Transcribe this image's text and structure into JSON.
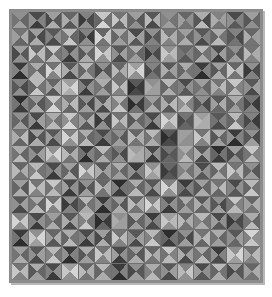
{
  "artwork": {
    "title": "Triangle Quilt Pattern",
    "kind": "generative-grid-art",
    "grid": {
      "columns": 15,
      "rows": 16
    },
    "cell_subdivision": "four-triangles-by-diagonals",
    "palette_name": "grayscale",
    "colors": {
      "page_background": "#ffffff",
      "frame": "#8c8c8c",
      "frame_shadow": "#5e5e5e",
      "cell_gap": "#6f6f6f"
    },
    "geometry": {
      "frame_x": 9,
      "frame_y": 9,
      "frame_width": 254,
      "frame_height": 274,
      "canvas_width": 248,
      "canvas_height": 268,
      "cell_width": 16.533,
      "cell_height": 16.75
    },
    "tone_levels": [
      "#1b1b1b",
      "#2d2d2d",
      "#3b3b3b",
      "#4a4a4a",
      "#585858",
      "#666666",
      "#747474",
      "#828282",
      "#909090",
      "#9e9e9e",
      "#acacac",
      "#b9b9b9",
      "#c7c7c7",
      "#d5d5d5",
      "#e3e3e3"
    ],
    "triangle_order": [
      "north",
      "east",
      "south",
      "west"
    ],
    "cells": [
      [
        [
          8,
          5,
          9,
          6
        ],
        [
          3,
          7,
          2,
          8
        ],
        [
          9,
          4,
          10,
          3
        ],
        [
          5,
          9,
          4,
          10
        ],
        [
          7,
          3,
          8,
          2
        ],
        [
          12,
          6,
          13,
          5
        ],
        [
          6,
          11,
          5,
          12
        ],
        [
          9,
          4,
          8,
          5
        ],
        [
          4,
          10,
          3,
          11
        ],
        [
          8,
          6,
          9,
          7
        ],
        [
          5,
          8,
          6,
          9
        ],
        [
          10,
          3,
          11,
          4
        ],
        [
          7,
          9,
          6,
          10
        ],
        [
          3,
          7,
          4,
          8
        ],
        [
          9,
          5,
          8,
          4
        ]
      ],
      [
        [
          6,
          10,
          5,
          9
        ],
        [
          9,
          3,
          10,
          4
        ],
        [
          4,
          8,
          3,
          7
        ],
        [
          11,
          5,
          12,
          6
        ],
        [
          7,
          2,
          8,
          3
        ],
        [
          5,
          12,
          6,
          13
        ],
        [
          10,
          6,
          9,
          5
        ],
        [
          3,
          9,
          4,
          10
        ],
        [
          8,
          4,
          7,
          3
        ],
        [
          6,
          10,
          7,
          11
        ],
        [
          9,
          5,
          10,
          6
        ],
        [
          4,
          7,
          3,
          8
        ],
        [
          10,
          6,
          11,
          5
        ],
        [
          7,
          3,
          6,
          4
        ],
        [
          5,
          9,
          6,
          10
        ]
      ],
      [
        [
          9,
          4,
          8,
          3
        ],
        [
          5,
          11,
          6,
          12
        ],
        [
          12,
          6,
          11,
          5
        ],
        [
          3,
          8,
          2,
          7
        ],
        [
          9,
          5,
          10,
          4
        ],
        [
          7,
          12,
          8,
          13
        ],
        [
          4,
          9,
          3,
          8
        ],
        [
          10,
          5,
          9,
          6
        ],
        [
          6,
          3,
          7,
          2
        ],
        [
          8,
          11,
          9,
          12
        ],
        [
          5,
          7,
          4,
          6
        ],
        [
          11,
          6,
          10,
          5
        ],
        [
          3,
          9,
          2,
          8
        ],
        [
          8,
          4,
          9,
          5
        ],
        [
          6,
          10,
          7,
          11
        ]
      ],
      [
        [
          2,
          8,
          1,
          7
        ],
        [
          10,
          5,
          11,
          6
        ],
        [
          6,
          12,
          7,
          13
        ],
        [
          4,
          9,
          3,
          10
        ],
        [
          11,
          6,
          10,
          5
        ],
        [
          8,
          4,
          9,
          3
        ],
        [
          5,
          10,
          6,
          11
        ],
        [
          9,
          13,
          8,
          12
        ],
        [
          7,
          4,
          6,
          3
        ],
        [
          4,
          9,
          5,
          10
        ],
        [
          10,
          6,
          9,
          5
        ],
        [
          2,
          7,
          1,
          6
        ],
        [
          9,
          5,
          10,
          4
        ],
        [
          5,
          11,
          6,
          12
        ],
        [
          8,
          3,
          7,
          2
        ]
      ],
      [
        [
          7,
          3,
          8,
          4
        ],
        [
          11,
          6,
          12,
          5
        ],
        [
          5,
          10,
          4,
          9
        ],
        [
          9,
          13,
          10,
          12
        ],
        [
          3,
          8,
          2,
          7
        ],
        [
          10,
          5,
          9,
          6
        ],
        [
          6,
          11,
          7,
          12
        ],
        [
          4,
          2,
          3,
          1
        ],
        [
          8,
          9,
          9,
          10
        ],
        [
          11,
          6,
          10,
          5
        ],
        [
          3,
          8,
          4,
          7
        ],
        [
          9,
          5,
          8,
          6
        ],
        [
          6,
          11,
          7,
          10
        ],
        [
          12,
          7,
          11,
          6
        ],
        [
          4,
          9,
          3,
          8
        ]
      ],
      [
        [
          1,
          7,
          2,
          6
        ],
        [
          9,
          4,
          10,
          5
        ],
        [
          12,
          7,
          13,
          6
        ],
        [
          6,
          11,
          5,
          10
        ],
        [
          8,
          3,
          9,
          4
        ],
        [
          4,
          10,
          3,
          9
        ],
        [
          11,
          6,
          12,
          7
        ],
        [
          7,
          2,
          6,
          1
        ],
        [
          9,
          5,
          10,
          6
        ],
        [
          5,
          11,
          4,
          10
        ],
        [
          12,
          7,
          11,
          8
        ],
        [
          8,
          3,
          7,
          4
        ],
        [
          4,
          10,
          5,
          9
        ],
        [
          10,
          6,
          9,
          5
        ],
        [
          6,
          2,
          7,
          3
        ]
      ],
      [
        [
          8,
          4,
          9,
          5
        ],
        [
          3,
          9,
          2,
          8
        ],
        [
          10,
          6,
          11,
          7
        ],
        [
          12,
          7,
          13,
          8
        ],
        [
          5,
          10,
          4,
          9
        ],
        [
          9,
          3,
          8,
          2
        ],
        [
          6,
          11,
          7,
          12
        ],
        [
          10,
          5,
          9,
          4
        ],
        [
          3,
          8,
          2,
          7
        ],
        [
          8,
          12,
          9,
          13
        ],
        [
          6,
          4,
          5,
          3
        ],
        [
          9,
          10,
          10,
          11
        ],
        [
          4,
          7,
          3,
          6
        ],
        [
          11,
          6,
          12,
          5
        ],
        [
          7,
          2,
          6,
          3
        ]
      ],
      [
        [
          6,
          11,
          5,
          10
        ],
        [
          9,
          4,
          10,
          3
        ],
        [
          4,
          8,
          3,
          9
        ],
        [
          7,
          12,
          8,
          13
        ],
        [
          10,
          5,
          11,
          6
        ],
        [
          3,
          7,
          2,
          6
        ],
        [
          8,
          4,
          9,
          5
        ],
        [
          5,
          10,
          6,
          11
        ],
        [
          11,
          7,
          10,
          6
        ],
        [
          4,
          2,
          3,
          1
        ],
        [
          9,
          8,
          8,
          9
        ],
        [
          6,
          11,
          7,
          12
        ],
        [
          10,
          5,
          9,
          4
        ],
        [
          2,
          7,
          1,
          8
        ],
        [
          8,
          3,
          9,
          4
        ]
      ],
      [
        [
          10,
          5,
          11,
          6
        ],
        [
          4,
          9,
          3,
          8
        ],
        [
          8,
          13,
          9,
          12
        ],
        [
          5,
          10,
          6,
          11
        ],
        [
          2,
          7,
          1,
          6
        ],
        [
          11,
          6,
          10,
          5
        ],
        [
          7,
          3,
          8,
          4
        ],
        [
          9,
          10,
          10,
          11
        ],
        [
          3,
          8,
          2,
          9
        ],
        [
          6,
          4,
          5,
          3
        ],
        [
          10,
          7,
          11,
          8
        ],
        [
          4,
          9,
          3,
          10
        ],
        [
          1,
          6,
          2,
          5
        ],
        [
          9,
          4,
          8,
          3
        ],
        [
          12,
          7,
          11,
          6
        ]
      ],
      [
        [
          5,
          10,
          6,
          11
        ],
        [
          11,
          6,
          12,
          7
        ],
        [
          3,
          8,
          2,
          7
        ],
        [
          9,
          4,
          10,
          5
        ],
        [
          7,
          12,
          8,
          13
        ],
        [
          4,
          9,
          5,
          10
        ],
        [
          10,
          5,
          9,
          6
        ],
        [
          2,
          7,
          3,
          8
        ],
        [
          8,
          11,
          9,
          12
        ],
        [
          5,
          3,
          4,
          2
        ],
        [
          9,
          6,
          10,
          7
        ],
        [
          3,
          8,
          4,
          9
        ],
        [
          11,
          6,
          10,
          5
        ],
        [
          6,
          11,
          7,
          12
        ],
        [
          8,
          4,
          9,
          5
        ]
      ],
      [
        [
          9,
          4,
          10,
          5
        ],
        [
          6,
          11,
          7,
          12
        ],
        [
          12,
          7,
          11,
          6
        ],
        [
          3,
          8,
          2,
          9
        ],
        [
          8,
          4,
          9,
          3
        ],
        [
          5,
          10,
          6,
          11
        ],
        [
          1,
          6,
          2,
          7
        ],
        [
          10,
          5,
          11,
          6
        ],
        [
          4,
          9,
          3,
          8
        ],
        [
          7,
          12,
          8,
          13
        ],
        [
          2,
          7,
          3,
          6
        ],
        [
          9,
          5,
          10,
          4
        ],
        [
          6,
          11,
          5,
          10
        ],
        [
          3,
          8,
          4,
          7
        ],
        [
          11,
          6,
          12,
          5
        ]
      ],
      [
        [
          4,
          9,
          3,
          8
        ],
        [
          10,
          5,
          11,
          6
        ],
        [
          6,
          12,
          7,
          13
        ],
        [
          8,
          3,
          7,
          2
        ],
        [
          11,
          6,
          10,
          5
        ],
        [
          2,
          7,
          1,
          8
        ],
        [
          9,
          4,
          10,
          5
        ],
        [
          5,
          10,
          6,
          11
        ],
        [
          7,
          12,
          8,
          13
        ],
        [
          3,
          8,
          2,
          7
        ],
        [
          10,
          6,
          9,
          5
        ],
        [
          4,
          9,
          5,
          10
        ],
        [
          8,
          3,
          9,
          4
        ],
        [
          12,
          7,
          11,
          6
        ],
        [
          5,
          10,
          6,
          9
        ]
      ],
      [
        [
          7,
          12,
          8,
          13
        ],
        [
          3,
          8,
          2,
          7
        ],
        [
          9,
          5,
          10,
          6
        ],
        [
          4,
          9,
          3,
          10
        ],
        [
          11,
          6,
          12,
          7
        ],
        [
          6,
          2,
          5,
          1
        ],
        [
          8,
          9,
          9,
          10
        ],
        [
          10,
          5,
          9,
          4
        ],
        [
          2,
          7,
          3,
          8
        ],
        [
          9,
          11,
          8,
          12
        ],
        [
          5,
          10,
          6,
          11
        ],
        [
          11,
          6,
          10,
          7
        ],
        [
          3,
          8,
          4,
          9
        ],
        [
          7,
          3,
          6,
          2
        ],
        [
          10,
          5,
          11,
          6
        ]
      ],
      [
        [
          2,
          7,
          1,
          6
        ],
        [
          8,
          13,
          9,
          12
        ],
        [
          5,
          10,
          4,
          9
        ],
        [
          10,
          6,
          11,
          5
        ],
        [
          3,
          8,
          2,
          7
        ],
        [
          9,
          4,
          10,
          3
        ],
        [
          6,
          11,
          7,
          12
        ],
        [
          4,
          9,
          3,
          8
        ],
        [
          11,
          6,
          12,
          7
        ],
        [
          1,
          6,
          2,
          5
        ],
        [
          8,
          3,
          9,
          4
        ],
        [
          6,
          11,
          5,
          10
        ],
        [
          10,
          5,
          9,
          6
        ],
        [
          4,
          9,
          5,
          8
        ],
        [
          13,
          8,
          12,
          7
        ]
      ],
      [
        [
          9,
          5,
          10,
          6
        ],
        [
          4,
          9,
          3,
          8
        ],
        [
          11,
          6,
          12,
          7
        ],
        [
          2,
          7,
          1,
          8
        ],
        [
          10,
          5,
          9,
          4
        ],
        [
          6,
          11,
          7,
          12
        ],
        [
          3,
          8,
          2,
          9
        ],
        [
          9,
          4,
          10,
          5
        ],
        [
          5,
          10,
          6,
          11
        ],
        [
          12,
          7,
          11,
          6
        ],
        [
          4,
          9,
          3,
          10
        ],
        [
          10,
          5,
          11,
          6
        ],
        [
          2,
          7,
          3,
          8
        ],
        [
          8,
          13,
          9,
          12
        ],
        [
          6,
          11,
          7,
          10
        ]
      ],
      [
        [
          6,
          11,
          7,
          12
        ],
        [
          10,
          5,
          9,
          4
        ],
        [
          3,
          8,
          2,
          7
        ],
        [
          9,
          13,
          8,
          12
        ],
        [
          5,
          10,
          6,
          11
        ],
        [
          11,
          6,
          10,
          5
        ],
        [
          2,
          7,
          1,
          6
        ],
        [
          8,
          4,
          9,
          3
        ],
        [
          10,
          6,
          11,
          7
        ],
        [
          4,
          9,
          3,
          8
        ],
        [
          7,
          12,
          8,
          11
        ],
        [
          3,
          8,
          4,
          9
        ],
        [
          11,
          6,
          10,
          5
        ],
        [
          9,
          4,
          8,
          3
        ],
        [
          5,
          10,
          6,
          9
        ]
      ]
    ]
  }
}
